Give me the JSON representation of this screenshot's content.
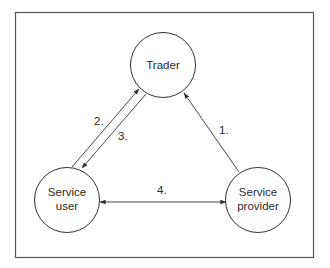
{
  "diagram": {
    "frame": {
      "x": 15,
      "y": 12,
      "width": 298,
      "height": 245,
      "stroke": "#555555"
    },
    "nodes": [
      {
        "id": "trader",
        "lines": [
          "Trader"
        ],
        "cx": 163,
        "cy": 65,
        "r": 32
      },
      {
        "id": "service-user",
        "lines": [
          "Service",
          "user"
        ],
        "cx": 67,
        "cy": 200,
        "r": 32
      },
      {
        "id": "service-provider",
        "lines": [
          "Service",
          "provider"
        ],
        "cx": 258,
        "cy": 200,
        "r": 32
      }
    ],
    "edges": [
      {
        "id": "edge-1",
        "label": "1.",
        "from": "service-provider",
        "to": "trader",
        "direction": "forward"
      },
      {
        "id": "edge-2",
        "label": "2.",
        "from": "service-user",
        "to": "trader",
        "direction": "forward"
      },
      {
        "id": "edge-3",
        "label": "3.",
        "from": "trader",
        "to": "service-user",
        "direction": "forward"
      },
      {
        "id": "edge-4",
        "label": "4.",
        "from": "service-user",
        "to": "service-provider",
        "direction": "both"
      }
    ],
    "colors": {
      "line": "#333333",
      "text": "#2a2a2a",
      "background": "#ffffff"
    }
  }
}
